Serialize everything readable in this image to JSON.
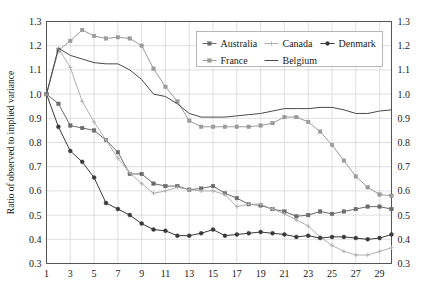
{
  "chart_data": {
    "type": "line",
    "title": "",
    "xlabel": "",
    "ylabel": "Ratio of observed to implied variance",
    "xlim": [
      1,
      30
    ],
    "ylim": [
      0.3,
      1.3
    ],
    "ytick_step": 0.1,
    "grid": true,
    "legend_position": "top-center-right",
    "x": [
      1,
      2,
      3,
      4,
      5,
      6,
      7,
      8,
      9,
      10,
      11,
      12,
      13,
      14,
      15,
      16,
      17,
      18,
      19,
      20,
      21,
      22,
      23,
      24,
      25,
      26,
      27,
      28,
      29,
      30
    ],
    "xticks": [
      1,
      3,
      5,
      7,
      9,
      11,
      13,
      15,
      17,
      19,
      21,
      23,
      25,
      27,
      29
    ],
    "yticks": [
      "0.3",
      "0.4",
      "0.5",
      "0.6",
      "0.7",
      "0.8",
      "0.9",
      "1.0",
      "1.1",
      "1.2",
      "1.3"
    ],
    "yticks_right": [
      "0.3",
      "0.4",
      "0.5",
      "0.6",
      "0.7",
      "0.8",
      "0.9",
      "1.0",
      "1.1",
      "1.2",
      "1.3"
    ],
    "series": [
      {
        "name": "Australia",
        "color": "#6b6b6b",
        "marker": "square",
        "values": [
          1.0,
          0.96,
          0.87,
          0.86,
          0.85,
          0.81,
          0.76,
          0.67,
          0.67,
          0.63,
          0.62,
          0.62,
          0.605,
          0.61,
          0.62,
          0.59,
          0.57,
          0.545,
          0.54,
          0.525,
          0.515,
          0.495,
          0.5,
          0.515,
          0.505,
          0.515,
          0.525,
          0.535,
          0.535,
          0.525
        ]
      },
      {
        "name": "Canada",
        "color": "#b0b0b0",
        "marker": "cross",
        "values": [
          1.0,
          1.19,
          1.11,
          0.97,
          0.885,
          0.81,
          0.735,
          0.675,
          0.63,
          0.59,
          0.6,
          0.615,
          0.605,
          0.6,
          0.6,
          0.585,
          0.535,
          0.545,
          0.545,
          0.525,
          0.505,
          0.48,
          0.455,
          0.41,
          0.375,
          0.35,
          0.335,
          0.335,
          0.35,
          0.365
        ]
      },
      {
        "name": "Denmark",
        "color": "#3a3a3a",
        "marker": "circle",
        "values": [
          1.0,
          0.865,
          0.765,
          0.72,
          0.655,
          0.55,
          0.525,
          0.5,
          0.465,
          0.44,
          0.435,
          0.415,
          0.415,
          0.425,
          0.44,
          0.415,
          0.42,
          0.425,
          0.43,
          0.425,
          0.42,
          0.41,
          0.415,
          0.405,
          0.41,
          0.41,
          0.405,
          0.4,
          0.405,
          0.42
        ]
      },
      {
        "name": "France",
        "color": "#9a9a9a",
        "marker": "square",
        "values": [
          1.0,
          1.18,
          1.22,
          1.265,
          1.24,
          1.23,
          1.235,
          1.23,
          1.2,
          1.105,
          1.03,
          0.97,
          0.89,
          0.865,
          0.865,
          0.865,
          0.865,
          0.865,
          0.87,
          0.88,
          0.905,
          0.905,
          0.885,
          0.845,
          0.79,
          0.725,
          0.66,
          0.615,
          0.585,
          0.58
        ]
      },
      {
        "name": "Belgium",
        "color": "#4a4a4a",
        "marker": "none",
        "values": [
          1.0,
          1.19,
          1.16,
          1.145,
          1.13,
          1.125,
          1.125,
          1.1,
          1.06,
          1.0,
          0.99,
          0.96,
          0.92,
          0.905,
          0.905,
          0.905,
          0.91,
          0.915,
          0.92,
          0.93,
          0.94,
          0.94,
          0.94,
          0.945,
          0.945,
          0.935,
          0.92,
          0.92,
          0.93,
          0.935
        ]
      }
    ]
  },
  "legend": {
    "entries": [
      {
        "label": "Australia"
      },
      {
        "label": "Canada"
      },
      {
        "label": "Denmark"
      },
      {
        "label": "France"
      },
      {
        "label": "Belgium"
      }
    ]
  },
  "axes": {
    "y_title": "Ratio of observed to implied variance"
  }
}
